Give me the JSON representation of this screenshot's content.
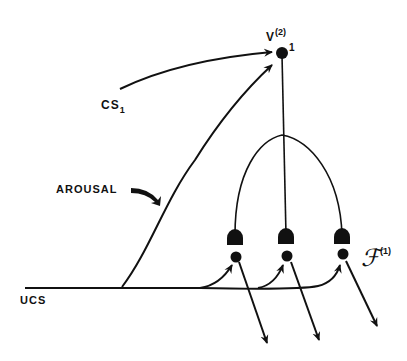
{
  "labels": {
    "v_node": "V",
    "v_sup": "(2)",
    "v_sub": "1",
    "cs": "CS",
    "cs_sub": "1",
    "arousal": "AROUSAL",
    "ucs": "UCS",
    "f_field": "ℱ",
    "f_sup": "(1)"
  },
  "colors": {
    "ink": "#111111",
    "background": "#ffffff"
  }
}
